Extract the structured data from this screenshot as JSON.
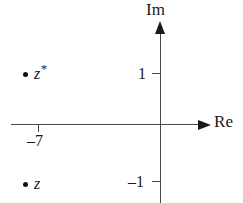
{
  "figure": {
    "type": "argand-diagram",
    "background_color": "#ffffff",
    "axis_color": "#4a4a4a",
    "point_color": "#111111"
  },
  "axes": {
    "real": {
      "label": "Re",
      "orientation": "horizontal",
      "arrow_direction": "right"
    },
    "imaginary": {
      "label": "Im",
      "orientation": "vertical",
      "arrow_direction": "up"
    }
  },
  "ticks": {
    "real": [
      {
        "label": "–7",
        "value": -7
      }
    ],
    "imaginary": [
      {
        "label": "1",
        "value": 1
      },
      {
        "label": "–1",
        "value": -1
      }
    ]
  },
  "points": [
    {
      "name": "z-conjugate",
      "label_base": "z",
      "label_superscript": "*",
      "real": -7,
      "imaginary": 1
    },
    {
      "name": "z",
      "label_base": "z",
      "label_superscript": "",
      "real": -7,
      "imaginary": -1
    }
  ],
  "chart_data": {
    "type": "scatter",
    "title": "",
    "xlabel": "Re",
    "ylabel": "Im",
    "xlim": [
      -9.5,
      2.2
    ],
    "ylim": [
      -1.9,
      2.5
    ],
    "grid": false,
    "legend": null,
    "xticks": [
      -7
    ],
    "xticklabels": [
      "–7"
    ],
    "yticks": [
      1,
      -1
    ],
    "yticklabels": [
      "1",
      "–1"
    ],
    "series": [
      {
        "name": "z*",
        "x": [
          -7
        ],
        "y": [
          1
        ],
        "labels": [
          "z*"
        ]
      },
      {
        "name": "z",
        "x": [
          -7
        ],
        "y": [
          -1
        ],
        "labels": [
          "z"
        ]
      }
    ],
    "annotations": [
      {
        "text": "z*",
        "x": -7,
        "y": 1,
        "position": "right-of-point"
      },
      {
        "text": "z",
        "x": -7,
        "y": -1,
        "position": "right-of-point"
      }
    ]
  }
}
